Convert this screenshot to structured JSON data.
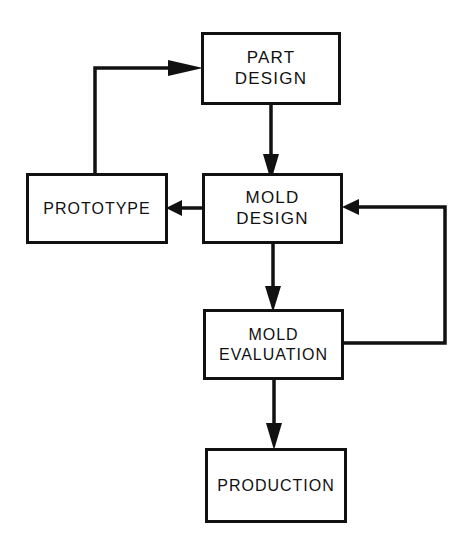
{
  "diagram": {
    "type": "flowchart",
    "background_color": "#ffffff",
    "line_color": "#111111",
    "nodes": [
      {
        "id": "part-design",
        "label": "PART\nDESIGN",
        "x": 201,
        "y": 32,
        "width": 140,
        "height": 73
      },
      {
        "id": "prototype",
        "label": "PROTOTYPE",
        "x": 26,
        "y": 173,
        "width": 142,
        "height": 71
      },
      {
        "id": "mold-design",
        "label": "MOLD\nDESIGN",
        "x": 202,
        "y": 173,
        "width": 141,
        "height": 71
      },
      {
        "id": "mold-evaluation",
        "label": "MOLD\nEVALUATION",
        "x": 203,
        "y": 309,
        "width": 141,
        "height": 71
      },
      {
        "id": "production",
        "label": "PRODUCTION",
        "x": 205,
        "y": 448,
        "width": 142,
        "height": 75
      }
    ],
    "edges": [
      {
        "id": "part-design-to-mold-design",
        "from": "part-design",
        "to": "mold-design",
        "direction": "down",
        "arrow": true
      },
      {
        "id": "mold-design-to-prototype",
        "from": "mold-design",
        "to": "prototype",
        "direction": "left",
        "arrow": true
      },
      {
        "id": "prototype-to-part-design",
        "from": "prototype",
        "to": "part-design",
        "direction": "up-right",
        "arrow": true
      },
      {
        "id": "mold-design-to-mold-evaluation",
        "from": "mold-design",
        "to": "mold-evaluation",
        "direction": "down",
        "arrow": true
      },
      {
        "id": "mold-evaluation-to-mold-design",
        "from": "mold-evaluation",
        "to": "mold-design",
        "direction": "right-up-left",
        "arrow": true
      },
      {
        "id": "mold-evaluation-to-production",
        "from": "mold-evaluation",
        "to": "production",
        "direction": "down",
        "arrow": true
      }
    ]
  }
}
